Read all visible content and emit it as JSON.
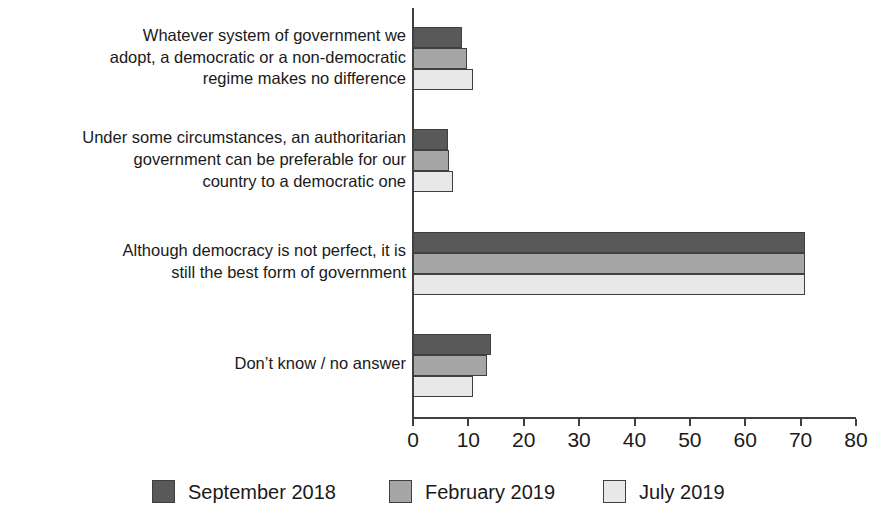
{
  "chart_data": {
    "type": "bar",
    "orientation": "horizontal",
    "title": "",
    "subtitle": "",
    "xlabel": "",
    "ylabel": "",
    "xlim": [
      0,
      80
    ],
    "xticks": [
      0,
      10,
      20,
      30,
      40,
      50,
      60,
      70,
      80
    ],
    "grid": false,
    "legend_position": "bottom",
    "categories": [
      "Whatever system of government we adopt, a democratic or a non-democratic regime makes no difference",
      "Under some circumstances, an authoritarian government can be preferable for our country to a democratic one",
      "Although democracy is not perfect, it is still the best form of government",
      "Don’t know / no answer"
    ],
    "category_lines": [
      [
        "Whatever system of government we",
        "adopt, a democratic or a non-democratic",
        "regime makes no difference"
      ],
      [
        "Under some circumstances, an authoritarian",
        "government can be preferable for our",
        "country to a democratic one"
      ],
      [
        "Although democracy is not perfect, it is",
        "still the best form of government"
      ],
      [
        "Don’t know / no answer"
      ]
    ],
    "series": [
      {
        "name": "September 2018",
        "color": "#595959",
        "values": [
          9,
          6.5,
          71,
          14.3
        ]
      },
      {
        "name": "February 2019",
        "color": "#a6a6a6",
        "values": [
          10,
          6.6,
          71,
          13.5
        ]
      },
      {
        "name": "July 2019",
        "color": "#e8e8e8",
        "values": [
          11,
          7.4,
          71,
          11
        ]
      }
    ]
  },
  "axis": {
    "tick_labels": [
      "0",
      "10",
      "20",
      "30",
      "40",
      "50",
      "60",
      "70",
      "80"
    ]
  },
  "legend": {
    "items": [
      {
        "label": "September 2018",
        "color": "#595959"
      },
      {
        "label": "February 2019",
        "color": "#a6a6a6"
      },
      {
        "label": "July 2019",
        "color": "#e8e8e8"
      }
    ]
  }
}
